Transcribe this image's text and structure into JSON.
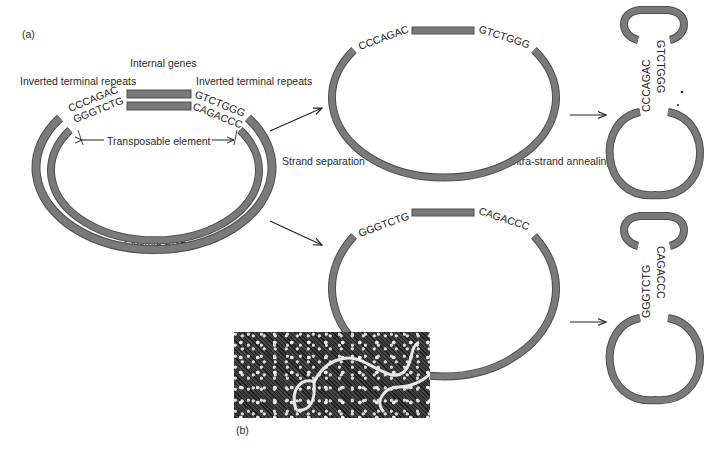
{
  "figure": {
    "panel_a_label": "(a)",
    "panel_b_label": "(b)"
  },
  "plasmid": {
    "label": "Plasmid DNA",
    "internal_genes_label": "Internal genes",
    "itr_left_label": "Inverted terminal repeats",
    "itr_right_label": "Inverted terminal repeats",
    "transposable_element_label": "Transposable element",
    "outer_left_seq": "CCCAGAC",
    "inner_left_seq": "GGGTCTG",
    "outer_right_seq": "GTCTGGG",
    "inner_right_seq": "CAGACCC"
  },
  "steps": {
    "strand_separation_label": "Strand separation",
    "intra_strand_annealing_label": "Intra-strand annealing"
  },
  "strand_top": {
    "left_seq": "CCCAGAC",
    "right_seq": "GTCTGGG"
  },
  "strand_bottom": {
    "left_seq": "GGGTCTG",
    "right_seq": "CAGACCC"
  },
  "hairpin_top": {
    "left_seq": "CCCAGAC",
    "right_seq": "GTCTGGG"
  },
  "hairpin_bottom": {
    "left_seq": "GGGTCTG",
    "right_seq": "CAGACCC"
  },
  "colors": {
    "strand": "#7a7a7a",
    "strand_edge": "#4e4e4e",
    "text": "#222222"
  }
}
